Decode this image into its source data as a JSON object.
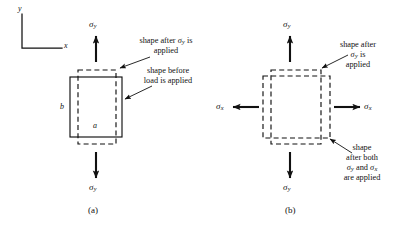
{
  "figure": {
    "type": "engineering-diagram",
    "axes": {
      "x_label": "x",
      "y_label": "y"
    },
    "stroke_color": "#111111",
    "background_color": "#ffffff"
  },
  "panel_a": {
    "caption": "(a)",
    "dimension_width_label": "a",
    "dimension_height_label": "b",
    "stress_top": {
      "symbol": "σ",
      "subscript": "y",
      "direction": "up"
    },
    "stress_bottom": {
      "symbol": "σ",
      "subscript": "y",
      "direction": "down"
    },
    "annotations": [
      {
        "id": "after-sigma-y",
        "lines": [
          "shape after σ",
          "is",
          "applied"
        ],
        "line1_prefix": "shape after ",
        "line1_symbol": "σ",
        "line1_sub": "y",
        "line1_suffix": " is",
        "line2": "applied"
      },
      {
        "id": "before-load",
        "line1": "shape before",
        "line2": "load is applied"
      }
    ]
  },
  "panel_b": {
    "caption": "(b)",
    "stress_top": {
      "symbol": "σ",
      "subscript": "y",
      "direction": "up"
    },
    "stress_bottom": {
      "symbol": "σ",
      "subscript": "y",
      "direction": "down"
    },
    "stress_left": {
      "symbol": "σ",
      "subscript": "x",
      "direction": "left"
    },
    "stress_right": {
      "symbol": "σ",
      "subscript": "x",
      "direction": "right"
    },
    "annotations": [
      {
        "id": "after-sigma-y",
        "line1": "shape after",
        "line2_symbol": "σ",
        "line2_sub": "y",
        "line2_suffix": " is",
        "line3": "applied"
      },
      {
        "id": "after-both",
        "line1": "shape",
        "line2": "after both",
        "line3_a": "σ",
        "line3_a_sub": "y",
        "line3_mid": " and ",
        "line3_b": "σ",
        "line3_b_sub": "x",
        "line4": "are applied"
      }
    ]
  }
}
